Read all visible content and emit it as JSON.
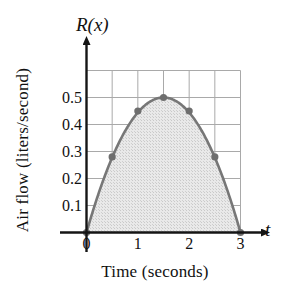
{
  "chart_data": {
    "type": "area",
    "title": "",
    "xlabel": "Time (seconds)",
    "ylabel": "Air flow (liters/second)",
    "x_axis_variable": "t",
    "y_axis_variable": "R(x)",
    "x": [
      0,
      0.5,
      1,
      1.5,
      2,
      2.5,
      3
    ],
    "values": [
      0,
      0.28,
      0.45,
      0.5,
      0.45,
      0.28,
      0
    ],
    "marked_points": [
      {
        "x": 0,
        "y": 0
      },
      {
        "x": 0.5,
        "y": 0.28
      },
      {
        "x": 1,
        "y": 0.45
      },
      {
        "x": 1.5,
        "y": 0.5
      },
      {
        "x": 2,
        "y": 0.45
      },
      {
        "x": 2.5,
        "y": 0.28
      },
      {
        "x": 3,
        "y": 0
      }
    ],
    "xlim": [
      0,
      3
    ],
    "ylim": [
      0,
      0.6
    ],
    "xticks": [
      0,
      1,
      2,
      3
    ],
    "xtick_labels": [
      "0",
      "1",
      "2",
      "3"
    ],
    "yticks": [
      0.1,
      0.2,
      0.3,
      0.4,
      0.5
    ],
    "ytick_labels": [
      "0.1",
      "0.2",
      "0.3",
      "0.4",
      "0.5"
    ],
    "x_gridlines": [
      0,
      0.5,
      1,
      1.5,
      2,
      2.5,
      3
    ],
    "y_gridlines": [
      0.1,
      0.2,
      0.3,
      0.4,
      0.5,
      0.6
    ],
    "grid": true,
    "legend": "none",
    "shaded_region": "area under curve from t=0 to t=3",
    "curve_color": "#777777",
    "fill_color": "#d8d8d8",
    "grid_color": "#a9a9a9",
    "axis_color": "#151515",
    "marker_color": "#6e6e6e"
  }
}
